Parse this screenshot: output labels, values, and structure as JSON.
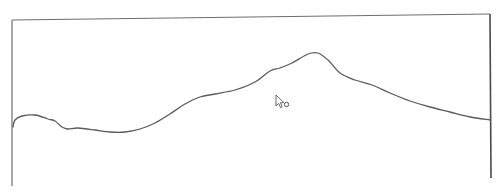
{
  "canvas": {
    "width": 501,
    "height": 195,
    "background": "#ffffff",
    "frame": {
      "stroke": "#6e6e6e",
      "right_stroke": "#4a4a4a",
      "left_edge": {
        "x1": 12,
        "y1": 20,
        "x2": 12,
        "y2": 186
      },
      "top_edge": {
        "x1": 12,
        "y1": 20,
        "x2": 490,
        "y2": 14
      },
      "right_edge": {
        "x1": 490,
        "y1": 14,
        "x2": 491,
        "y2": 178
      }
    },
    "stroke": {
      "color": "#5a5a5a",
      "width": 1.3,
      "points": [
        [
          13,
          127
        ],
        [
          15,
          120
        ],
        [
          22,
          116
        ],
        [
          35,
          115
        ],
        [
          48,
          119
        ],
        [
          55,
          121
        ],
        [
          62,
          127
        ],
        [
          68,
          129
        ],
        [
          78,
          128
        ],
        [
          95,
          130
        ],
        [
          110,
          132
        ],
        [
          125,
          132
        ],
        [
          140,
          129
        ],
        [
          155,
          123
        ],
        [
          170,
          114
        ],
        [
          185,
          104
        ],
        [
          200,
          97
        ],
        [
          215,
          94
        ],
        [
          235,
          90
        ],
        [
          255,
          82
        ],
        [
          270,
          71
        ],
        [
          280,
          68
        ],
        [
          292,
          63
        ],
        [
          308,
          54
        ],
        [
          318,
          53
        ],
        [
          328,
          60
        ],
        [
          340,
          73
        ],
        [
          355,
          80
        ],
        [
          372,
          85
        ],
        [
          390,
          93
        ],
        [
          410,
          101
        ],
        [
          430,
          107
        ],
        [
          450,
          112
        ],
        [
          470,
          117
        ],
        [
          490,
          120
        ]
      ]
    },
    "cursor": {
      "type": "arrow-busy",
      "x": 276,
      "y": 95
    }
  }
}
